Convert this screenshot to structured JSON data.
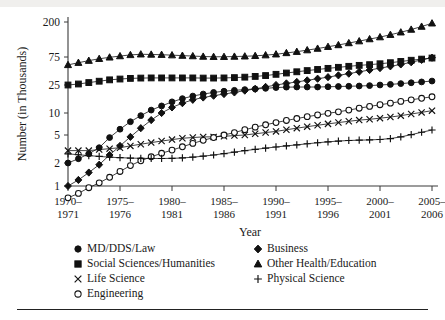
{
  "figure": {
    "background_color": "#ffffff",
    "ink_color": "#111111",
    "top_band_color": "#f0efed",
    "has_bottom_rule": true
  },
  "axes": {
    "y_title": "Number (in Thousands)",
    "x_title": "Year",
    "y_ticks": [
      "200",
      "75",
      "25",
      "10",
      "5",
      "2",
      "1"
    ],
    "x_ticks": [
      {
        "line1": "1970–",
        "line2": "1971"
      },
      {
        "line1": "1975–",
        "line2": "1976"
      },
      {
        "line1": "1980–",
        "line2": "1981"
      },
      {
        "line1": "1985–",
        "line2": "1986"
      },
      {
        "line1": "1990–",
        "line2": "1991"
      },
      {
        "line1": "1995–",
        "line2": "1996"
      },
      {
        "line1": "2000–",
        "line2": "2001"
      },
      {
        "line1": "2005–",
        "line2": "2006"
      }
    ]
  },
  "legend": {
    "columns": [
      [
        {
          "label": "MD/DDS/Law",
          "marker": "filled-circle-icon"
        },
        {
          "label": "Social Sciences/Humanities",
          "marker": "filled-square-icon"
        },
        {
          "label": "Life Science",
          "marker": "cross-x-icon"
        },
        {
          "label": "Engineering",
          "marker": "open-circle-icon"
        }
      ],
      [
        {
          "label": "Business",
          "marker": "filled-diamond-icon"
        },
        {
          "label": "Other Health/Education",
          "marker": "filled-triangle-icon"
        },
        {
          "label": "Physical Science",
          "marker": "plus-icon"
        }
      ]
    ]
  },
  "chart_data": {
    "type": "line",
    "title": "",
    "xlabel": "Year",
    "ylabel": "Number (in Thousands)",
    "y_scale": "log",
    "ylim": [
      0.6,
      230
    ],
    "y_tick_values": [
      1,
      2,
      5,
      10,
      25,
      75,
      200
    ],
    "grid": false,
    "legend_position": "below-axes",
    "x": [
      "1970-1971",
      "1971-1972",
      "1972-1973",
      "1973-1974",
      "1974-1975",
      "1975-1976",
      "1976-1977",
      "1977-1978",
      "1978-1979",
      "1979-1980",
      "1980-1981",
      "1981-1982",
      "1982-1983",
      "1983-1984",
      "1984-1985",
      "1985-1986",
      "1986-1987",
      "1987-1988",
      "1988-1989",
      "1989-1990",
      "1990-1991",
      "1991-1992",
      "1992-1993",
      "1993-1994",
      "1994-1995",
      "1995-1996",
      "1996-1997",
      "1997-1998",
      "1998-1999",
      "1999-2000",
      "2000-2001",
      "2001-2002",
      "2002-2003",
      "2003-2004",
      "2004-2005",
      "2005-2006"
    ],
    "series": [
      {
        "name": "MD/DDS/Law",
        "marker": "filled-circle",
        "values": [
          2.0,
          2.3,
          2.7,
          3.3,
          4.6,
          6.0,
          7.6,
          9.2,
          11.0,
          12.6,
          14.4,
          16.0,
          17.4,
          18.6,
          19.6,
          20.4,
          21.0,
          21.5,
          22.0,
          22.4,
          23.0,
          23.3,
          23.4,
          23.4,
          23.4,
          23.6,
          23.8,
          24.0,
          24.2,
          24.5,
          25.0,
          25.6,
          26.4,
          27.3,
          28.2,
          29.2
        ]
      },
      {
        "name": "Social Sciences/Humanities",
        "marker": "filled-square",
        "values": [
          25.0,
          26.0,
          27.5,
          29.0,
          30.6,
          31.6,
          32.4,
          32.8,
          33.0,
          33.0,
          33.0,
          33.0,
          33.0,
          32.8,
          32.8,
          33.0,
          33.4,
          34.0,
          35.0,
          36.2,
          38.0,
          40.0,
          42.0,
          44.0,
          46.0,
          48.0,
          50.0,
          52.0,
          54.0,
          55.5,
          57.5,
          60.0,
          63.0,
          66.0,
          69.0,
          72.0
        ]
      },
      {
        "name": "Life Science",
        "marker": "cross-x",
        "values": [
          3.0,
          3.0,
          3.0,
          3.1,
          3.2,
          3.3,
          3.5,
          3.7,
          3.9,
          4.1,
          4.3,
          4.5,
          4.6,
          4.7,
          4.7,
          4.8,
          4.9,
          5.0,
          5.2,
          5.4,
          5.6,
          5.9,
          6.2,
          6.5,
          6.8,
          7.1,
          7.4,
          7.7,
          8.0,
          8.2,
          8.5,
          8.8,
          9.2,
          9.7,
          10.2,
          10.8
        ]
      },
      {
        "name": "Engineering",
        "marker": "open-circle",
        "values": [
          0.7,
          0.8,
          0.95,
          1.1,
          1.3,
          1.55,
          1.85,
          2.15,
          2.45,
          2.75,
          3.05,
          3.4,
          3.8,
          4.2,
          4.6,
          5.0,
          5.4,
          5.9,
          6.4,
          6.9,
          7.4,
          7.9,
          8.4,
          8.9,
          9.4,
          9.9,
          10.4,
          11.0,
          11.7,
          12.4,
          13.1,
          13.8,
          14.6,
          15.4,
          16.2,
          17.0
        ]
      },
      {
        "name": "Business",
        "marker": "filled-diamond",
        "values": [
          1.0,
          1.2,
          1.5,
          1.9,
          2.6,
          3.5,
          4.7,
          6.2,
          8.0,
          10.0,
          12.0,
          13.8,
          15.4,
          16.6,
          17.6,
          18.6,
          19.6,
          20.8,
          22.0,
          23.5,
          25.0,
          26.6,
          28.2,
          30.0,
          32.0,
          34.0,
          36.5,
          39.0,
          42.0,
          45.0,
          48.5,
          52.0,
          56.0,
          61.0,
          67.0,
          73.0
        ]
      },
      {
        "name": "Other Health/Education",
        "marker": "filled-triangle",
        "values": [
          55.0,
          60.0,
          65.0,
          70.0,
          74.0,
          77.0,
          79.5,
          81.0,
          80.5,
          80.0,
          79.0,
          78.0,
          77.0,
          76.0,
          75.5,
          75.5,
          76.0,
          76.5,
          77.5,
          79.0,
          81.0,
          84.0,
          87.0,
          91.0,
          95.0,
          100.0,
          105.0,
          111.0,
          117.0,
          124.0,
          131.0,
          140.0,
          150.0,
          162.0,
          176.0,
          193.0
        ]
      },
      {
        "name": "Physical Science",
        "marker": "plus",
        "values": [
          2.7,
          2.62,
          2.55,
          2.48,
          2.42,
          2.38,
          2.35,
          2.33,
          2.32,
          2.32,
          2.33,
          2.36,
          2.42,
          2.5,
          2.6,
          2.72,
          2.85,
          3.0,
          3.12,
          3.25,
          3.38,
          3.5,
          3.62,
          3.75,
          3.88,
          4.0,
          4.1,
          4.18,
          4.22,
          4.26,
          4.32,
          4.45,
          4.7,
          5.05,
          5.45,
          5.85
        ]
      }
    ]
  }
}
